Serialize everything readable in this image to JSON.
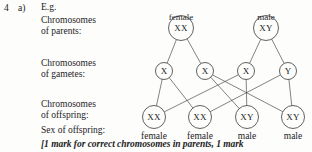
{
  "question": {
    "number": "4",
    "part": "a)",
    "example_label": "E.g."
  },
  "row_labels": {
    "parents_line1": "Chromosomes",
    "parents_line2": "of parents:",
    "gametes_line1": "Chromosomes",
    "gametes_line2": "of gametes:",
    "offspring_line1": "Chromosomes",
    "offspring_line2": "of offspring:",
    "sex_of_offspring": "Sex of offspring:"
  },
  "diagram": {
    "parents": [
      {
        "caption": "female",
        "genotype": "XX",
        "cx": 181,
        "cy": 28,
        "r": 12.5
      },
      {
        "caption": "male",
        "genotype": "XY",
        "cx": 266,
        "cy": 28,
        "r": 12.5
      }
    ],
    "gametes": [
      {
        "allele": "X",
        "cx": 164,
        "cy": 71,
        "r": 8.5
      },
      {
        "allele": "X",
        "cx": 205,
        "cy": 71,
        "r": 8.5
      },
      {
        "allele": "X",
        "cx": 246,
        "cy": 71,
        "r": 8.5
      },
      {
        "allele": "Y",
        "cx": 288,
        "cy": 71,
        "r": 8.5
      }
    ],
    "offspring": [
      {
        "genotype": "XX",
        "sex": "female",
        "cx": 154,
        "cy": 117,
        "r": 11.5
      },
      {
        "genotype": "XX",
        "sex": "female",
        "cx": 200,
        "cy": 117,
        "r": 11.5
      },
      {
        "genotype": "XY",
        "sex": "male",
        "cx": 247,
        "cy": 117,
        "r": 11.5
      },
      {
        "genotype": "XY",
        "sex": "male",
        "cx": 293,
        "cy": 117,
        "r": 11.5
      }
    ],
    "parent_caption_y": 13,
    "offspring_caption_y": 131,
    "stroke_color": "#4d4d4d",
    "circle_color": "#3a3a3a"
  },
  "marking_note": "[1 mark for correct chromosomes in parents, 1 mark",
  "page_background": "#fdfdfc",
  "text_color": "#1c1c1c"
}
